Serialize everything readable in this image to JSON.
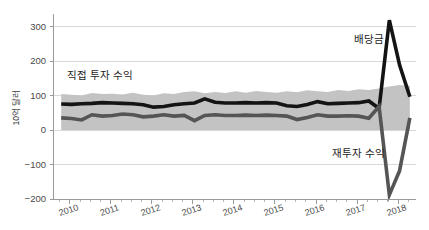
{
  "chart_data": {
    "type": "line",
    "title": "",
    "subtitle": "",
    "xlabel": "",
    "ylabel": "10억 달러",
    "ylim": [
      -200,
      330
    ],
    "xlim": [
      2009.6,
      2018.45
    ],
    "grid": true,
    "grid_axis": "y",
    "legend_position": "inline-annotation",
    "y_ticks": [
      300,
      200,
      100,
      0,
      -100,
      -200
    ],
    "y_tick_labels": [
      "300",
      "200",
      "100",
      "0",
      "−100",
      "−200"
    ],
    "x_ticks": [
      2010,
      2011,
      2012,
      2013,
      2014,
      2015,
      2016,
      2017,
      2018
    ],
    "x_tick_labels": [
      "2010",
      "2011",
      "2012",
      "2013",
      "2014",
      "2015",
      "2016",
      "2017",
      "2018"
    ],
    "x_minor_ticks_per_year": 4,
    "annotations": [
      {
        "text": "직접 투자 수익",
        "x": 2010.75,
        "y": 148,
        "anchor": "middle"
      },
      {
        "text": "배당금",
        "x": 2017.3,
        "y": 253,
        "anchor": "middle"
      },
      {
        "text": "재투자 수익",
        "x": 2017.05,
        "y": -78,
        "anchor": "middle"
      }
    ],
    "band": {
      "name": "직접 투자 수익 범위",
      "color": "#c3c3c3",
      "opacity": 1,
      "x": [
        2009.8,
        2010.05,
        2010.3,
        2010.55,
        2010.8,
        2011.05,
        2011.3,
        2011.55,
        2011.8,
        2012.05,
        2012.3,
        2012.55,
        2012.8,
        2013.05,
        2013.3,
        2013.55,
        2013.8,
        2014.05,
        2014.3,
        2014.55,
        2014.8,
        2015.05,
        2015.3,
        2015.55,
        2015.8,
        2016.05,
        2016.3,
        2016.55,
        2016.8,
        2017.05,
        2017.3,
        2017.55,
        2017.8,
        2018.05,
        2018.3
      ],
      "upper": [
        104,
        102,
        100,
        107,
        104,
        105,
        103,
        108,
        102,
        100,
        106,
        104,
        110,
        112,
        106,
        110,
        107,
        112,
        108,
        113,
        110,
        108,
        112,
        109,
        115,
        112,
        110,
        116,
        113,
        118,
        116,
        120,
        126,
        130,
        128
      ],
      "lower": [
        0,
        0,
        0,
        0,
        0,
        0,
        0,
        0,
        0,
        0,
        0,
        0,
        0,
        0,
        0,
        0,
        0,
        0,
        0,
        0,
        0,
        0,
        0,
        0,
        0,
        0,
        0,
        0,
        0,
        0,
        0,
        0,
        0,
        0,
        0
      ]
    },
    "series": [
      {
        "name": "배당금",
        "color": "#141414",
        "width": 3.6,
        "x": [
          2009.8,
          2010.05,
          2010.3,
          2010.55,
          2010.8,
          2011.05,
          2011.3,
          2011.55,
          2011.8,
          2012.05,
          2012.3,
          2012.55,
          2012.8,
          2013.05,
          2013.3,
          2013.55,
          2013.8,
          2014.05,
          2014.3,
          2014.55,
          2014.8,
          2015.05,
          2015.3,
          2015.55,
          2015.8,
          2016.05,
          2016.3,
          2016.55,
          2016.8,
          2017.05,
          2017.3,
          2017.55,
          2017.8,
          2018.05,
          2018.3
        ],
        "values": [
          75,
          74,
          76,
          77,
          79,
          78,
          77,
          76,
          73,
          66,
          68,
          73,
          76,
          78,
          90,
          80,
          78,
          78,
          79,
          78,
          79,
          78,
          70,
          68,
          74,
          82,
          76,
          77,
          78,
          79,
          84,
          62,
          318,
          188,
          96
        ]
      },
      {
        "name": "재투자 수익",
        "color": "#555555",
        "width": 3.6,
        "x": [
          2009.8,
          2010.05,
          2010.3,
          2010.55,
          2010.8,
          2011.05,
          2011.3,
          2011.55,
          2011.8,
          2012.05,
          2012.3,
          2012.55,
          2012.8,
          2013.05,
          2013.3,
          2013.55,
          2013.8,
          2014.05,
          2014.3,
          2014.55,
          2014.8,
          2015.05,
          2015.3,
          2015.55,
          2015.8,
          2016.05,
          2016.3,
          2016.55,
          2016.8,
          2017.05,
          2017.3,
          2017.55,
          2017.8,
          2018.05,
          2018.3
        ],
        "values": [
          35,
          33,
          29,
          44,
          40,
          42,
          46,
          44,
          38,
          40,
          44,
          40,
          42,
          27,
          42,
          44,
          42,
          42,
          43,
          42,
          43,
          42,
          40,
          30,
          36,
          44,
          40,
          40,
          41,
          40,
          34,
          68,
          -188,
          -118,
          35
        ]
      }
    ]
  },
  "figure": {
    "background": "#ffffff",
    "axis_color": "#9a9a9a",
    "grid_color": "#d9d9d9",
    "tick_text_color": "#4a4a4a"
  }
}
